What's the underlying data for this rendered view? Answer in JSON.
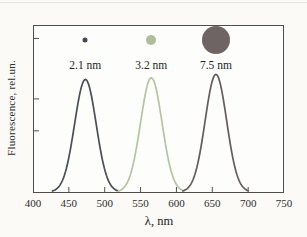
{
  "figure": {
    "xlabel": "λ, nm",
    "ylabel": "Fluorescence, rel.un."
  },
  "chart_data": {
    "type": "line",
    "title": "",
    "subtitle": "Quantum-dot fluorescence spectra; filled circles above peaks depict relative dot size",
    "xlabel": "λ, nm",
    "ylabel": "Fluorescence, rel.un.",
    "xlim": [
      400,
      750
    ],
    "ylim": [
      0,
      1
    ],
    "x_ticks": [
      400,
      450,
      500,
      550,
      600,
      650,
      700,
      750
    ],
    "y_ticks_unlabeled_rel": [
      0.08,
      0.44,
      0.63
    ],
    "grid": false,
    "legend_position": "none",
    "axis_color": "#4e4e4e",
    "series": [
      {
        "name": "2.1 nm",
        "curve": "gaussian",
        "peak_x": 473,
        "sigma": 15,
        "peak_y": 0.67,
        "span_nm": 46,
        "color": "#4a4e56",
        "marker_color": "#44484f",
        "marker_diameter_px": 5
      },
      {
        "name": "3.2 nm",
        "curve": "gaussian",
        "peak_x": 565,
        "sigma": 15,
        "peak_y": 0.68,
        "span_nm": 46,
        "color": "#b5c4a1",
        "marker_color": "#aebd9c",
        "marker_diameter_px": 10
      },
      {
        "name": "7.5 nm",
        "curve": "gaussian",
        "peak_x": 655,
        "sigma": 15,
        "peak_y": 0.7,
        "span_nm": 46,
        "color": "#635d5d",
        "marker_color": "#6d6463",
        "marker_diameter_px": 28
      }
    ]
  }
}
